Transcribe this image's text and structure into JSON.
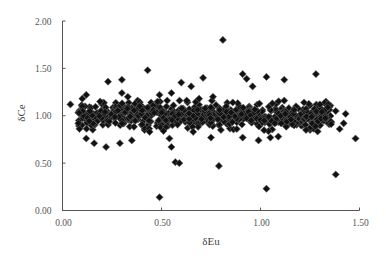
{
  "chart_data": {
    "type": "scatter",
    "title": "",
    "xlabel": "δEu",
    "ylabel": "δCe",
    "xlim": [
      0,
      1.5
    ],
    "ylim": [
      0,
      2.0
    ],
    "x_ticks": [
      "0.00",
      "0.50",
      "1.00",
      "1.50"
    ],
    "y_ticks": [
      "0.00",
      "0.50",
      "1.00",
      "1.50",
      "2.00"
    ],
    "grid": false,
    "legend": null,
    "marker": "filled-diamond",
    "marker_color": "#111111",
    "series": [
      {
        "name": "samples",
        "outliers": [
          [
            0.04,
            1.12
          ],
          [
            0.23,
            1.36
          ],
          [
            0.3,
            1.38
          ],
          [
            0.43,
            1.48
          ],
          [
            0.3,
            1.24
          ],
          [
            0.33,
            1.2
          ],
          [
            0.6,
            1.35
          ],
          [
            0.65,
            1.31
          ],
          [
            0.71,
            1.4
          ],
          [
            0.81,
            1.8
          ],
          [
            0.91,
            1.44
          ],
          [
            0.93,
            1.39
          ],
          [
            0.96,
            1.31
          ],
          [
            1.03,
            1.41
          ],
          [
            1.12,
            1.38
          ],
          [
            1.28,
            1.44
          ],
          [
            1.12,
            1.16
          ],
          [
            1.38,
            1.05
          ],
          [
            1.43,
            1.02
          ],
          [
            1.48,
            0.76
          ],
          [
            1.38,
            0.38
          ],
          [
            1.03,
            0.23
          ],
          [
            0.79,
            0.47
          ],
          [
            0.49,
            0.14
          ],
          [
            0.57,
            0.51
          ],
          [
            0.59,
            0.5
          ],
          [
            0.55,
            0.67
          ],
          [
            0.12,
            0.76
          ],
          [
            0.16,
            0.71
          ],
          [
            0.22,
            0.67
          ],
          [
            0.29,
            0.71
          ],
          [
            0.35,
            0.74
          ],
          [
            0.51,
            0.84
          ],
          [
            0.54,
            0.76
          ],
          [
            0.75,
            0.77
          ],
          [
            0.91,
            0.77
          ],
          [
            0.99,
            0.74
          ],
          [
            1.05,
            0.77
          ],
          [
            1.09,
            0.78
          ],
          [
            0.08,
            0.92
          ],
          [
            0.1,
            1.18
          ],
          [
            0.12,
            1.22
          ],
          [
            0.19,
            1.15
          ],
          [
            0.49,
            1.22
          ],
          [
            0.55,
            1.24
          ],
          [
            0.39,
            1.1
          ],
          [
            0.48,
            1.15
          ],
          [
            0.69,
            1.18
          ],
          [
            0.76,
            1.2
          ],
          [
            0.86,
            1.14
          ],
          [
            1.06,
            1.13
          ],
          [
            1.22,
            1.14
          ],
          [
            1.3,
            1.12
          ],
          [
            1.34,
            1.09
          ],
          [
            1.42,
            0.92
          ],
          [
            1.4,
            0.86
          ],
          [
            1.23,
            0.85
          ],
          [
            0.8,
            0.85
          ],
          [
            0.66,
            0.83
          ],
          [
            0.44,
            0.83
          ]
        ],
        "cluster": {
          "description": "dense band of several hundred points",
          "x_range": [
            0.08,
            1.36
          ],
          "y_center": 1.0,
          "y_spread": [
            0.82,
            1.16
          ],
          "count_approx": 700
        }
      }
    ]
  }
}
